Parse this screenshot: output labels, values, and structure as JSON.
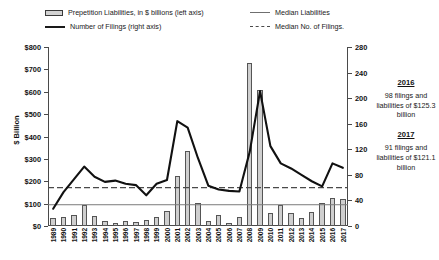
{
  "legend": {
    "items": [
      {
        "marker": "bar-swatch-icon",
        "label": "Prepetition Liabilities, in $ billions (left axis)"
      },
      {
        "marker": "thick-line-icon",
        "label": "Number of Filings (right axis)"
      },
      {
        "marker": "thin-line-icon",
        "label": "Median Liabilities"
      },
      {
        "marker": "dashed-line-icon",
        "label": "Median No. of Filings."
      }
    ]
  },
  "notes": [
    {
      "year": "2016",
      "text": "98 filings and liabilities of $125.3 billion"
    },
    {
      "year": "2017",
      "text": "91 filings and liabilities of $121.1 billion"
    }
  ],
  "chart_data": {
    "type": "bar",
    "title": "",
    "xlabel": "",
    "ylabel": "$ Billion",
    "y2label": "",
    "ylim": [
      0,
      800
    ],
    "y2lim": [
      0,
      280
    ],
    "yticks": [
      "$0",
      "$100",
      "$200",
      "$300",
      "$400",
      "$500",
      "$600",
      "$700",
      "$800"
    ],
    "y2ticks": [
      "0",
      "40",
      "80",
      "120",
      "160",
      "200",
      "240",
      "280"
    ],
    "grid": false,
    "legend_position": "top",
    "categories": [
      "1989",
      "1990",
      "1991",
      "1992",
      "1993",
      "1994",
      "1995",
      "1996",
      "1997",
      "1998",
      "1999",
      "2000",
      "2001",
      "2002",
      "2003",
      "2004",
      "2005",
      "2006",
      "2007",
      "2008",
      "2009",
      "2010",
      "2011",
      "2012",
      "2013",
      "2014",
      "2015",
      "2016",
      "2017"
    ],
    "series": [
      {
        "name": "Prepetition Liabilities, in $ billions (left axis)",
        "type": "bar",
        "axis": "left",
        "values": [
          35,
          42,
          50,
          95,
          45,
          22,
          14,
          24,
          16,
          28,
          40,
          68,
          222,
          335,
          105,
          22,
          47,
          15,
          40,
          730,
          610,
          60,
          95,
          58,
          38,
          61,
          102,
          125.3,
          121.1
        ]
      },
      {
        "name": "Number of Filings (right axis)",
        "type": "line",
        "axis": "right",
        "values": [
          27,
          53,
          73,
          93,
          77,
          69,
          71,
          66,
          64,
          48,
          66,
          72,
          164,
          154,
          106,
          63,
          57,
          55,
          54,
          116,
          211,
          125,
          98,
          90,
          80,
          70,
          62,
          98,
          91
        ]
      },
      {
        "name": "Median Liabilities",
        "type": "hline",
        "axis": "left",
        "value": 95
      },
      {
        "name": "Median No. of Filings.",
        "type": "hline",
        "axis": "right",
        "value": 60
      }
    ]
  }
}
